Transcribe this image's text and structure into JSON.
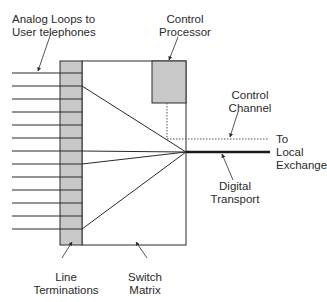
{
  "diagram": {
    "type": "telephone switch block diagram",
    "labels": {
      "analog_loops": [
        "Analog Loops to",
        "User telephones"
      ],
      "control_processor": [
        "Control",
        "Processor"
      ],
      "control_channel": [
        "Control",
        "Channel"
      ],
      "to_local_exchange": [
        "To",
        "Local",
        "Exchange"
      ],
      "digital_transport": [
        "Digital",
        "Transport"
      ],
      "line_terminations": [
        "Line",
        "Terminations"
      ],
      "switch_matrix": [
        "Switch",
        "Matrix"
      ]
    },
    "components": [
      {
        "id": "line-terminations",
        "count": 13
      },
      {
        "id": "switch-matrix"
      },
      {
        "id": "control-processor"
      },
      {
        "id": "control-channel",
        "style": "dotted"
      },
      {
        "id": "digital-transport",
        "style": "thick"
      }
    ],
    "colors": {
      "block_fill": "#c8c8c8",
      "stroke": "#2a2a2a",
      "background": "#ffffff"
    }
  }
}
